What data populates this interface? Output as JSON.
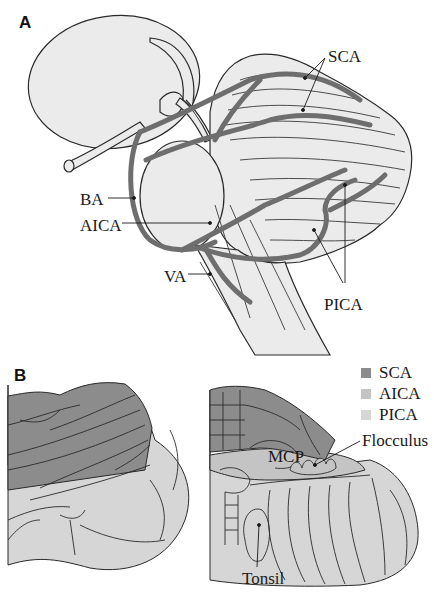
{
  "panels": [
    {
      "id": "A",
      "label": "A",
      "title": "Lateral view of brainstem and cerebellum with cerebellar arteries",
      "annotations": [
        {
          "text": "SCA",
          "meaning": "Superior cerebellar artery"
        },
        {
          "text": "BA",
          "meaning": "Basilar artery"
        },
        {
          "text": "AICA",
          "meaning": "Anterior inferior cerebellar artery"
        },
        {
          "text": "VA",
          "meaning": "Vertebral artery"
        },
        {
          "text": "PICA",
          "meaning": "Posterior inferior cerebellar artery"
        }
      ]
    },
    {
      "id": "B",
      "label": "B",
      "title": "Vascular territories of the cerebellum",
      "annotations": [
        {
          "text": "MCP"
        },
        {
          "text": "Flocculus"
        },
        {
          "text": "Tonsil"
        }
      ],
      "legend": [
        {
          "label": "SCA",
          "color": "#8c8c8c"
        },
        {
          "label": "AICA",
          "color": "#c4c4c4"
        },
        {
          "label": "PICA",
          "color": "#d6d6d6"
        }
      ]
    }
  ],
  "colors": {
    "artery": "#6e6e6e",
    "tissue": "#ebebeb",
    "outline": "#2a2a2a",
    "sca_territory": "#8c8c8c",
    "aica_territory": "#c4c4c4",
    "pica_territory": "#d6d6d6"
  }
}
